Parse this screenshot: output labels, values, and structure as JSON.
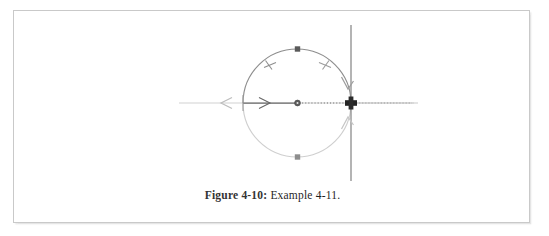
{
  "figure": {
    "caption_label": "Figure 4-10:",
    "caption_text": "Example 4-11.",
    "frame_color": "#c9c9c9",
    "background": "#ffffff"
  },
  "diagram": {
    "colors": {
      "axis_light": "#cfcfcf",
      "axis_mid": "#b9b9b9",
      "locus_upper": "#8b8b8b",
      "locus_lower": "#cdcdcd",
      "real_axis_segment": "#6e6e6e",
      "dotted_segment": "#7a7a7a",
      "vertical_axis": "#8a8a8a",
      "marker_dark": "#5f5f5f",
      "cross_marker": "#2a2a2a"
    },
    "elements": [
      {
        "name": "horizontal-real-axis",
        "type": "axis",
        "label": "real axis"
      },
      {
        "name": "vertical-imaginary-axis",
        "type": "axis",
        "label": "imaginary axis"
      },
      {
        "name": "circular-locus",
        "type": "circle",
        "center_x": 283,
        "center_y": 92,
        "radius": 54
      },
      {
        "name": "locus-center-pole",
        "type": "dot",
        "x": 283,
        "y": 92
      },
      {
        "name": "locus-top-zero",
        "type": "square",
        "x": 283,
        "y": 38
      },
      {
        "name": "locus-bottom-zero",
        "type": "square",
        "x": 283,
        "y": 146
      },
      {
        "name": "imaginary-axis-crossing",
        "type": "cross",
        "x": 337,
        "y": 92
      },
      {
        "name": "real-axis-arrow-right",
        "type": "arrow",
        "direction": "right"
      },
      {
        "name": "real-axis-arrow-left",
        "type": "arrow",
        "direction": "left"
      },
      {
        "name": "locus-arrow-upper-right",
        "type": "arrow",
        "direction": "down"
      },
      {
        "name": "locus-arrow-lower-right",
        "type": "arrow",
        "direction": "up"
      },
      {
        "name": "locus-tick-upper-left",
        "type": "tick"
      },
      {
        "name": "locus-tick-upper-right",
        "type": "tick"
      }
    ]
  }
}
